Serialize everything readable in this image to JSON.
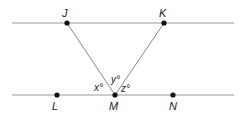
{
  "diagram": {
    "lines": [
      {
        "name": "top-parallel-line",
        "x1": 12,
        "y1": 23,
        "x2": 234,
        "y2": 23
      },
      {
        "name": "bottom-parallel-line",
        "x1": 12,
        "y1": 95,
        "x2": 234,
        "y2": 95
      },
      {
        "name": "segment-JM",
        "from": "J",
        "to": "M"
      },
      {
        "name": "segment-KM",
        "from": "K",
        "to": "M"
      }
    ],
    "points": {
      "J": {
        "label": "J",
        "x": 67,
        "y": 23
      },
      "K": {
        "label": "K",
        "x": 164,
        "y": 23
      },
      "L": {
        "label": "L",
        "x": 57,
        "y": 95
      },
      "M": {
        "label": "M",
        "x": 115,
        "y": 95
      },
      "N": {
        "label": "N",
        "x": 173,
        "y": 95
      }
    },
    "angles": {
      "x": "x°",
      "y": "y°",
      "z": "z°"
    },
    "colors": {
      "line": "#999999",
      "point": "#111111",
      "text": "#222222"
    }
  }
}
